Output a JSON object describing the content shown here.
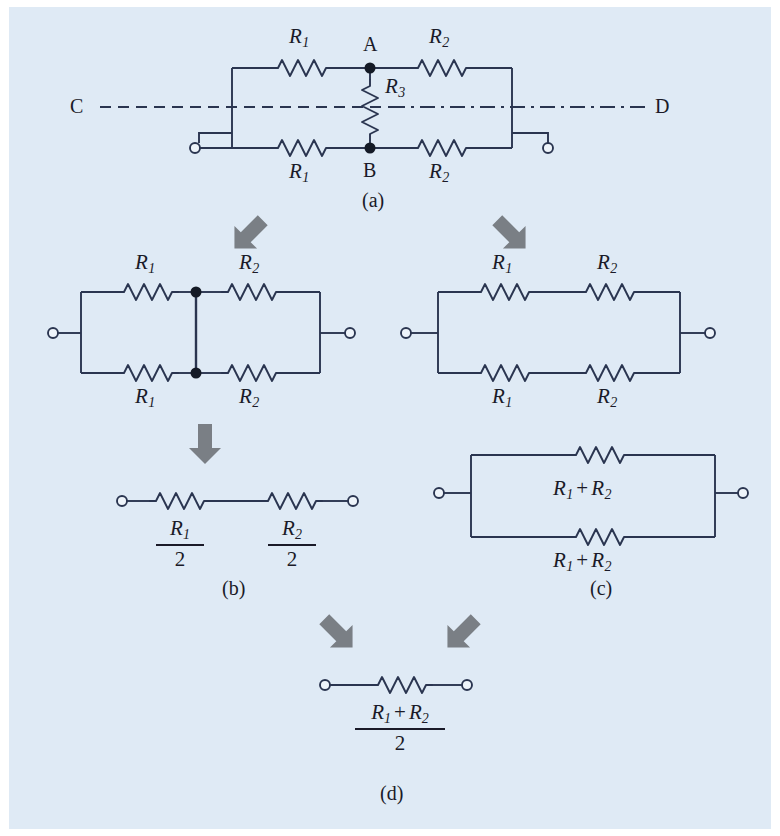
{
  "figure": {
    "background_color": "#dfeaf5",
    "line_color": "#2a3550",
    "arrow_color": "#7a7f85",
    "text_color": "#1a1a28"
  },
  "labels": {
    "R1": "R",
    "R1_sub": "1",
    "R2": "R",
    "R2_sub": "2",
    "R3": "R",
    "R3_sub": "3",
    "node_a": "A",
    "node_b": "B",
    "axis_left": "C",
    "axis_right": "D",
    "two": "2",
    "plus": "+"
  },
  "captions": {
    "a": "(a)",
    "b": "(b)",
    "c": "(c)",
    "d": "(d)"
  },
  "panels": {
    "a": {
      "caption": "(a)",
      "resistors": [
        "R1",
        "R2",
        "R1",
        "R2",
        "R3"
      ],
      "nodes": [
        "A",
        "B"
      ],
      "symmetry_axis": [
        "C",
        "D"
      ],
      "axis_style": "dashed-left dash-dot-right"
    },
    "b_top": {
      "caption": "",
      "resistors": [
        "R1",
        "R2",
        "R1",
        "R2"
      ],
      "note": "A and B shorted together"
    },
    "b_final": {
      "caption": "(b)",
      "resistors": [
        "R1/2",
        "R2/2"
      ],
      "numerators": [
        "R1",
        "R2"
      ],
      "denominator": "2"
    },
    "c_top": {
      "caption": "",
      "resistors": [
        "R1",
        "R2",
        "R1",
        "R2"
      ],
      "note": "A-B branch removed"
    },
    "c_final": {
      "caption": "(c)",
      "branches": [
        "R1 + R2",
        "R1 + R2"
      ]
    },
    "d": {
      "caption": "(d)",
      "numerator": "R1 + R2",
      "denominator": "2"
    }
  },
  "arrows": [
    {
      "name": "arrow-a-to-b",
      "direction": "down-left"
    },
    {
      "name": "arrow-a-to-c",
      "direction": "down-right"
    },
    {
      "name": "arrow-b-top-to-b-final",
      "direction": "down"
    },
    {
      "name": "arrow-b-to-d",
      "direction": "down-right"
    },
    {
      "name": "arrow-c-to-d",
      "direction": "down-left"
    }
  ]
}
